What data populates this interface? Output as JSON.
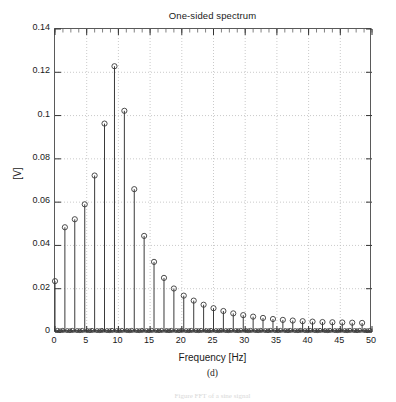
{
  "figure": {
    "subfigure_label": "(d)",
    "faint_caption": "Figure  FFT of a sine signal"
  },
  "chart_data": {
    "type": "scatter",
    "plot_style": "stem",
    "title": "One-sided spectrum",
    "xlabel": "Frequency [Hz]",
    "ylabel": "[V]",
    "xlim": [
      0,
      50
    ],
    "ylim": [
      0,
      0.14
    ],
    "grid": true,
    "grid_style": "dotted",
    "legend": null,
    "marker": "open-circle",
    "line_color": "#3a3a3a",
    "xticks": [
      0,
      5,
      10,
      15,
      20,
      25,
      30,
      35,
      40,
      45,
      50
    ],
    "xtick_labels": [
      "0",
      "5",
      "10",
      "15",
      "20",
      "25",
      "30",
      "35",
      "40",
      "45",
      "50"
    ],
    "yticks": [
      0,
      0.02,
      0.04,
      0.06,
      0.08,
      0.1,
      0.12,
      0.14
    ],
    "ytick_labels": [
      "0",
      "0.02",
      "0.04",
      "0.06",
      "0.08",
      "0.1",
      "0.12",
      "0.14"
    ],
    "x_minor_tick_step": 1.25,
    "series": [
      {
        "name": "one-sided amplitude spectrum",
        "x": [
          0,
          1.56,
          3.12,
          4.69,
          6.25,
          7.81,
          9.38,
          10.94,
          12.5,
          14.06,
          15.62,
          17.19,
          18.75,
          20.31,
          21.88,
          23.44,
          25.0,
          26.56,
          28.12,
          29.69,
          31.25,
          32.81,
          34.38,
          35.94,
          37.5,
          39.06,
          40.62,
          42.19,
          43.75,
          45.31,
          46.88,
          48.44
        ],
        "y": [
          0.0235,
          0.0484,
          0.0521,
          0.059,
          0.0723,
          0.0963,
          0.1228,
          0.1022,
          0.066,
          0.0444,
          0.0324,
          0.025,
          0.0201,
          0.0168,
          0.0145,
          0.0126,
          0.011,
          0.0097,
          0.0086,
          0.0078,
          0.0071,
          0.0065,
          0.006,
          0.0056,
          0.0053,
          0.005,
          0.0048,
          0.0046,
          0.0045,
          0.0044,
          0.0043,
          0.0042
        ]
      },
      {
        "name": "baseline near-zero samples",
        "x": [
          0.4,
          0.8,
          1.2,
          1.95,
          2.35,
          2.75,
          3.5,
          3.9,
          4.3,
          5.1,
          5.5,
          5.85,
          6.65,
          7.05,
          7.4,
          8.2,
          8.6,
          9.0,
          9.75,
          10.15,
          10.55,
          11.35,
          11.75,
          12.1,
          12.9,
          13.3,
          13.7,
          14.45,
          14.85,
          15.25,
          16.0,
          16.4,
          16.8,
          17.6,
          18.0,
          18.35,
          19.15,
          19.55,
          19.95,
          20.7,
          21.1,
          21.5,
          22.25,
          22.65,
          23.05,
          23.85,
          24.25,
          24.6,
          25.4,
          25.8,
          26.2,
          26.95,
          27.35,
          27.75,
          28.5,
          28.9,
          29.3,
          30.1,
          30.5,
          30.85,
          31.65,
          32.05,
          32.45,
          33.2,
          33.6,
          34.0,
          34.75,
          35.15,
          35.55,
          36.35,
          36.75,
          37.1,
          37.9,
          38.3,
          38.7,
          39.45,
          39.85,
          40.25,
          41.0,
          41.4,
          41.8,
          42.6,
          43.0,
          43.35,
          44.15,
          44.55,
          44.95,
          45.7,
          46.1,
          46.5,
          47.25,
          47.65,
          48.05,
          48.85,
          49.25,
          49.65
        ],
        "y": [
          0.0008,
          0.0006,
          0.0008,
          0.0007,
          0.0006,
          0.0008,
          0.0007,
          0.0006,
          0.0008,
          0.0007,
          0.0006,
          0.0008,
          0.0007,
          0.0006,
          0.0008,
          0.0007,
          0.0006,
          0.0008,
          0.0007,
          0.0006,
          0.0008,
          0.0007,
          0.0006,
          0.0008,
          0.0007,
          0.0006,
          0.0008,
          0.0007,
          0.0006,
          0.0008,
          0.0007,
          0.0006,
          0.0008,
          0.0007,
          0.0006,
          0.0008,
          0.0007,
          0.0006,
          0.0008,
          0.0007,
          0.0006,
          0.0008,
          0.0007,
          0.0006,
          0.0008,
          0.0007,
          0.0006,
          0.0008,
          0.0007,
          0.0006,
          0.0008,
          0.0007,
          0.0006,
          0.0008,
          0.0007,
          0.0006,
          0.0008,
          0.0007,
          0.0006,
          0.0008,
          0.0007,
          0.0006,
          0.0008,
          0.0007,
          0.0006,
          0.0008,
          0.0007,
          0.0006,
          0.0008,
          0.0007,
          0.0006,
          0.0008,
          0.0007,
          0.0006,
          0.0008,
          0.0007,
          0.0006,
          0.0008,
          0.0007,
          0.0006,
          0.0008,
          0.0007,
          0.0006,
          0.0008,
          0.0007,
          0.0006,
          0.0008,
          0.0007,
          0.0006,
          0.0008,
          0.0007,
          0.0006,
          0.0008,
          0.0007,
          0.0006,
          0.0008
        ]
      }
    ]
  }
}
